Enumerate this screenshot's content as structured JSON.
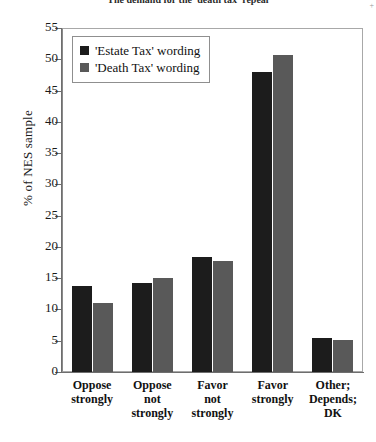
{
  "figure": {
    "title": "The demand for the 'death tax' repeal",
    "corner_mark": "+"
  },
  "chart_data": {
    "type": "bar",
    "title": "",
    "xlabel": "",
    "ylabel": "% of NES sample",
    "ylim": [
      0,
      55
    ],
    "ytick_step": 5,
    "grid": false,
    "legend_position": "top-left",
    "categories": [
      "Oppose strongly",
      "Oppose not strongly",
      "Favor not strongly",
      "Favor strongly",
      "Other; Depends; DK"
    ],
    "category_lines": [
      [
        "Oppose",
        "strongly"
      ],
      [
        "Oppose",
        "not",
        "strongly"
      ],
      [
        "Favor",
        "not",
        "strongly"
      ],
      [
        "Favor",
        "strongly"
      ],
      [
        "Other;",
        "Depends;",
        "DK"
      ]
    ],
    "yticks": [
      0,
      5,
      10,
      15,
      20,
      25,
      30,
      35,
      40,
      45,
      50,
      55
    ],
    "series": [
      {
        "name": "'Estate Tax' wording",
        "color": "#1c1c1c",
        "values": [
          13.8,
          14.2,
          18.4,
          48.0,
          5.4
        ]
      },
      {
        "name": "'Death Tax' wording",
        "color": "#595959",
        "values": [
          11.0,
          15.0,
          17.8,
          50.7,
          5.1
        ]
      }
    ]
  }
}
